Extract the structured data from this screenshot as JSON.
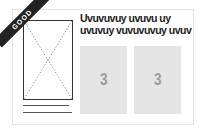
{
  "badge": {
    "label": "GOOD"
  },
  "title": {
    "line1": "Uvuvuvuy uvuvu uy",
    "line2": "uvuvuy vuvuvuvuy uvuv"
  },
  "panels": [
    {
      "number": "3"
    },
    {
      "number": "3"
    }
  ],
  "colors": {
    "ribbon": "#222222",
    "panel": "#e5e5e5",
    "panel_text": "#9c9c9c"
  }
}
